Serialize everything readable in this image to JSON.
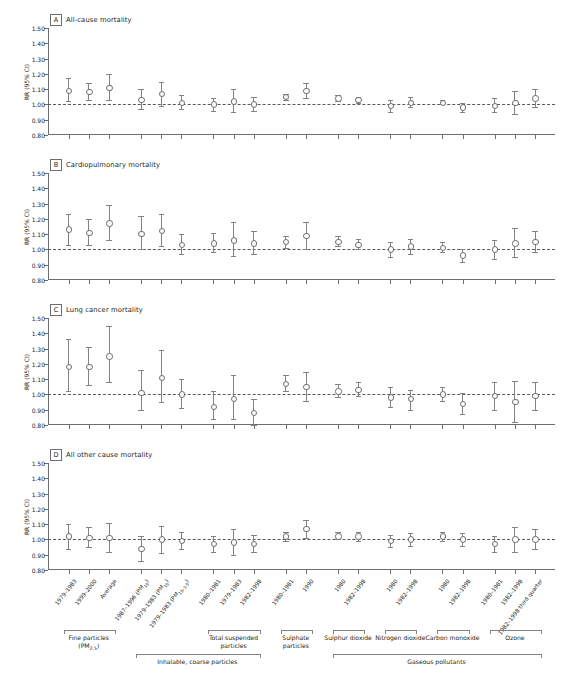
{
  "figure": {
    "y_axis_title": "RR (95% CI)",
    "y_ticks": [
      "1.50",
      "1.40",
      "1.30",
      "1.20",
      "1.10",
      "1.00",
      "0.90",
      "0.80"
    ],
    "y_min": 0.8,
    "y_max": 1.5,
    "reference_line": 1.0,
    "marker_color": "#6d6e71",
    "line_color": "#808285",
    "axis_color": "#6d6e71"
  },
  "x_categories": [
    {
      "label": "1979–1983"
    },
    {
      "label": "1999–2000"
    },
    {
      "label": "Average"
    },
    {
      "label": "1987–1996 (PM<sub>15</sub>)"
    },
    {
      "label": "1979–1983 (PM<sub>15</sub>)"
    },
    {
      "label": "1979–1983 (PM<sub>15–2.5</sub>)"
    },
    {
      "label": "1980–1981"
    },
    {
      "label": "1979–1983"
    },
    {
      "label": "1982–1998"
    },
    {
      "label": "1980–1981"
    },
    {
      "label": "1990"
    },
    {
      "label": "1980"
    },
    {
      "label": "1982–1998"
    },
    {
      "label": "1980"
    },
    {
      "label": "1982–1998"
    },
    {
      "label": "1980"
    },
    {
      "label": "1982–1998"
    },
    {
      "label": "1980–1981"
    },
    {
      "label": "1982–1998"
    },
    {
      "label": "1982–1998 third quarter"
    }
  ],
  "groups": [
    {
      "label": "Fine particles (PM<sub>2.5</sub>)",
      "start": 0,
      "end": 2,
      "tier": 1
    },
    {
      "label": "Total suspended particles",
      "start": 6,
      "end": 8,
      "tier": 1
    },
    {
      "label": "Sulphate particles",
      "start": 9,
      "end": 10,
      "tier": 1
    },
    {
      "label": "Sulphur dioxide",
      "start": 11,
      "end": 12,
      "tier": 1
    },
    {
      "label": "Nitrogen dioxide",
      "start": 13,
      "end": 14,
      "tier": 1
    },
    {
      "label": "Carbon monoxide",
      "start": 15,
      "end": 16,
      "tier": 1
    },
    {
      "label": "Ozone",
      "start": 17,
      "end": 19,
      "tier": 1
    },
    {
      "label": "Inhalable, coarse particles",
      "start": 3,
      "end": 8,
      "tier": 2
    },
    {
      "label": "Gaseous pollutants",
      "start": 11,
      "end": 19,
      "tier": 2
    }
  ],
  "chart_data": {
    "type": "scatter",
    "xlabel": "",
    "ylabel": "RR (95% CI)",
    "ylim": [
      0.8,
      1.5
    ],
    "grid": false,
    "legend": "none",
    "panels": [
      {
        "id": "A",
        "title": "All-cause mortality",
        "points": [
          {
            "x": 0,
            "rr": 1.09,
            "lo": 1.02,
            "hi": 1.17
          },
          {
            "x": 1,
            "rr": 1.08,
            "lo": 1.03,
            "hi": 1.14
          },
          {
            "x": 2,
            "rr": 1.11,
            "lo": 1.03,
            "hi": 1.2
          },
          {
            "x": 3,
            "rr": 1.03,
            "lo": 0.97,
            "hi": 1.1
          },
          {
            "x": 4,
            "rr": 1.07,
            "lo": 0.99,
            "hi": 1.15
          },
          {
            "x": 5,
            "rr": 1.01,
            "lo": 0.97,
            "hi": 1.06
          },
          {
            "x": 6,
            "rr": 1.0,
            "lo": 0.96,
            "hi": 1.04
          },
          {
            "x": 7,
            "rr": 1.02,
            "lo": 0.95,
            "hi": 1.1
          },
          {
            "x": 8,
            "rr": 1.0,
            "lo": 0.96,
            "hi": 1.05
          },
          {
            "x": 9,
            "rr": 1.05,
            "lo": 1.03,
            "hi": 1.07
          },
          {
            "x": 10,
            "rr": 1.09,
            "lo": 1.04,
            "hi": 1.14
          },
          {
            "x": 11,
            "rr": 1.04,
            "lo": 1.02,
            "hi": 1.06
          },
          {
            "x": 12,
            "rr": 1.03,
            "lo": 1.01,
            "hi": 1.05
          },
          {
            "x": 13,
            "rr": 0.99,
            "lo": 0.95,
            "hi": 1.03
          },
          {
            "x": 14,
            "rr": 1.01,
            "lo": 0.98,
            "hi": 1.05
          },
          {
            "x": 15,
            "rr": 1.01,
            "lo": 1.0,
            "hi": 1.03
          },
          {
            "x": 16,
            "rr": 0.98,
            "lo": 0.95,
            "hi": 1.01
          },
          {
            "x": 17,
            "rr": 0.99,
            "lo": 0.95,
            "hi": 1.04
          },
          {
            "x": 18,
            "rr": 1.01,
            "lo": 0.94,
            "hi": 1.09
          },
          {
            "x": 19,
            "rr": 1.04,
            "lo": 0.98,
            "hi": 1.1
          }
        ]
      },
      {
        "id": "B",
        "title": "Cardiopulmonary mortality",
        "points": [
          {
            "x": 0,
            "rr": 1.13,
            "lo": 1.03,
            "hi": 1.23
          },
          {
            "x": 1,
            "rr": 1.11,
            "lo": 1.03,
            "hi": 1.2
          },
          {
            "x": 2,
            "rr": 1.17,
            "lo": 1.06,
            "hi": 1.29
          },
          {
            "x": 3,
            "rr": 1.1,
            "lo": 1.0,
            "hi": 1.22
          },
          {
            "x": 4,
            "rr": 1.12,
            "lo": 1.02,
            "hi": 1.23
          },
          {
            "x": 5,
            "rr": 1.03,
            "lo": 0.97,
            "hi": 1.1
          },
          {
            "x": 6,
            "rr": 1.04,
            "lo": 0.98,
            "hi": 1.11
          },
          {
            "x": 7,
            "rr": 1.06,
            "lo": 0.96,
            "hi": 1.18
          },
          {
            "x": 8,
            "rr": 1.04,
            "lo": 0.97,
            "hi": 1.12
          },
          {
            "x": 9,
            "rr": 1.05,
            "lo": 1.01,
            "hi": 1.09
          },
          {
            "x": 10,
            "rr": 1.09,
            "lo": 1.0,
            "hi": 1.18
          },
          {
            "x": 11,
            "rr": 1.05,
            "lo": 1.02,
            "hi": 1.09
          },
          {
            "x": 12,
            "rr": 1.03,
            "lo": 1.0,
            "hi": 1.07
          },
          {
            "x": 13,
            "rr": 1.0,
            "lo": 0.95,
            "hi": 1.05
          },
          {
            "x": 14,
            "rr": 1.02,
            "lo": 0.97,
            "hi": 1.07
          },
          {
            "x": 15,
            "rr": 1.01,
            "lo": 0.98,
            "hi": 1.05
          },
          {
            "x": 16,
            "rr": 0.96,
            "lo": 0.92,
            "hi": 1.0
          },
          {
            "x": 17,
            "rr": 1.0,
            "lo": 0.94,
            "hi": 1.06
          },
          {
            "x": 18,
            "rr": 1.04,
            "lo": 0.95,
            "hi": 1.14
          },
          {
            "x": 19,
            "rr": 1.05,
            "lo": 0.98,
            "hi": 1.12
          }
        ]
      },
      {
        "id": "C",
        "title": "Lung cancer mortality",
        "points": [
          {
            "x": 0,
            "rr": 1.18,
            "lo": 1.02,
            "hi": 1.36
          },
          {
            "x": 1,
            "rr": 1.18,
            "lo": 1.06,
            "hi": 1.31
          },
          {
            "x": 2,
            "rr": 1.25,
            "lo": 1.08,
            "hi": 1.45
          },
          {
            "x": 3,
            "rr": 1.01,
            "lo": 0.9,
            "hi": 1.16
          },
          {
            "x": 4,
            "rr": 1.11,
            "lo": 0.95,
            "hi": 1.29
          },
          {
            "x": 5,
            "rr": 1.0,
            "lo": 0.91,
            "hi": 1.1
          },
          {
            "x": 6,
            "rr": 0.92,
            "lo": 0.84,
            "hi": 1.02
          },
          {
            "x": 7,
            "rr": 0.97,
            "lo": 0.84,
            "hi": 1.13
          },
          {
            "x": 8,
            "rr": 0.88,
            "lo": 0.79,
            "hi": 0.97
          },
          {
            "x": 9,
            "rr": 1.07,
            "lo": 1.02,
            "hi": 1.13
          },
          {
            "x": 10,
            "rr": 1.05,
            "lo": 0.96,
            "hi": 1.15
          },
          {
            "x": 11,
            "rr": 1.02,
            "lo": 0.98,
            "hi": 1.07
          },
          {
            "x": 12,
            "rr": 1.03,
            "lo": 0.99,
            "hi": 1.08
          },
          {
            "x": 13,
            "rr": 0.98,
            "lo": 0.92,
            "hi": 1.05
          },
          {
            "x": 14,
            "rr": 0.97,
            "lo": 0.9,
            "hi": 1.03
          },
          {
            "x": 15,
            "rr": 1.0,
            "lo": 0.96,
            "hi": 1.05
          },
          {
            "x": 16,
            "rr": 0.94,
            "lo": 0.87,
            "hi": 1.01
          },
          {
            "x": 17,
            "rr": 0.99,
            "lo": 0.9,
            "hi": 1.08
          },
          {
            "x": 18,
            "rr": 0.95,
            "lo": 0.82,
            "hi": 1.09
          },
          {
            "x": 19,
            "rr": 0.99,
            "lo": 0.9,
            "hi": 1.08
          }
        ]
      },
      {
        "id": "D",
        "title": "All other cause mortality",
        "points": [
          {
            "x": 0,
            "rr": 1.02,
            "lo": 0.94,
            "hi": 1.1
          },
          {
            "x": 1,
            "rr": 1.01,
            "lo": 0.95,
            "hi": 1.08
          },
          {
            "x": 2,
            "rr": 1.01,
            "lo": 0.92,
            "hi": 1.11
          },
          {
            "x": 3,
            "rr": 0.94,
            "lo": 0.86,
            "hi": 1.02
          },
          {
            "x": 4,
            "rr": 1.0,
            "lo": 0.91,
            "hi": 1.09
          },
          {
            "x": 5,
            "rr": 0.99,
            "lo": 0.94,
            "hi": 1.05
          },
          {
            "x": 6,
            "rr": 0.97,
            "lo": 0.92,
            "hi": 1.02
          },
          {
            "x": 7,
            "rr": 0.98,
            "lo": 0.9,
            "hi": 1.07
          },
          {
            "x": 8,
            "rr": 0.97,
            "lo": 0.92,
            "hi": 1.03
          },
          {
            "x": 9,
            "rr": 1.02,
            "lo": 0.99,
            "hi": 1.05
          },
          {
            "x": 10,
            "rr": 1.07,
            "lo": 1.01,
            "hi": 1.13
          },
          {
            "x": 11,
            "rr": 1.02,
            "lo": 1.0,
            "hi": 1.05
          },
          {
            "x": 12,
            "rr": 1.02,
            "lo": 0.99,
            "hi": 1.05
          },
          {
            "x": 13,
            "rr": 0.99,
            "lo": 0.95,
            "hi": 1.03
          },
          {
            "x": 14,
            "rr": 1.0,
            "lo": 0.96,
            "hi": 1.04
          },
          {
            "x": 15,
            "rr": 1.02,
            "lo": 0.99,
            "hi": 1.05
          },
          {
            "x": 16,
            "rr": 1.0,
            "lo": 0.96,
            "hi": 1.04
          },
          {
            "x": 17,
            "rr": 0.97,
            "lo": 0.92,
            "hi": 1.02
          },
          {
            "x": 18,
            "rr": 1.0,
            "lo": 0.92,
            "hi": 1.08
          },
          {
            "x": 19,
            "rr": 1.0,
            "lo": 0.94,
            "hi": 1.07
          }
        ]
      }
    ]
  }
}
